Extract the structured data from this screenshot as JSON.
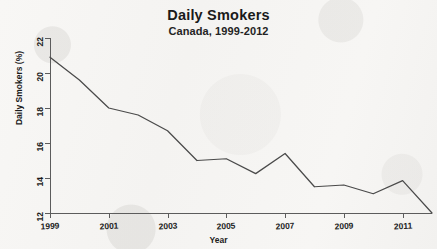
{
  "chart_data": {
    "type": "line",
    "title": "Daily Smokers",
    "subtitle": "Canada, 1999-2012",
    "xlabel": "Year",
    "ylabel": "Daily Smokers (%)",
    "grid": false,
    "legend": "none",
    "xlim": [
      1999,
      2012
    ],
    "ylim": [
      12,
      22
    ],
    "xticks": [
      1999,
      2001,
      2003,
      2005,
      2007,
      2009,
      2011
    ],
    "xtick_labels": [
      "1999",
      "2001",
      "2003",
      "2005",
      "2007",
      "2009",
      "2011"
    ],
    "yticks": [
      12,
      14,
      16,
      18,
      20,
      22
    ],
    "ytick_labels": [
      "12",
      "14",
      "16",
      "18",
      "20",
      "22"
    ],
    "x": [
      1999,
      2000,
      2001,
      2002,
      2003,
      2004,
      2005,
      2006,
      2007,
      2008,
      2009,
      2010,
      2011,
      2012
    ],
    "series": [
      {
        "name": "Daily Smokers (%)",
        "color": "#4a4a4a",
        "values": [
          20.9,
          19.6,
          18.0,
          17.6,
          16.7,
          15.0,
          15.1,
          14.25,
          15.4,
          13.5,
          13.6,
          13.1,
          13.85,
          12.0
        ]
      }
    ]
  },
  "figure": {
    "background_color": "#f6f5f3",
    "axis_color": "#5c5c5c",
    "text_color": "#1a1a1a"
  }
}
